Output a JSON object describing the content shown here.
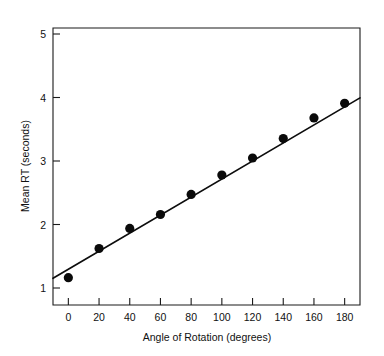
{
  "chart_data": {
    "type": "scatter",
    "title": "",
    "xlabel": "Angle of Rotation (degrees)",
    "ylabel": "Mean RT (seconds)",
    "xlim": [
      -10,
      190
    ],
    "ylim": [
      0.72,
      5.28
    ],
    "grid": false,
    "legend": null,
    "xticks": [
      0,
      20,
      40,
      60,
      80,
      100,
      120,
      140,
      160,
      180
    ],
    "xticklabels": [
      "0",
      "20",
      "40",
      "60",
      "80",
      "100",
      "120",
      "140",
      "160",
      "180"
    ],
    "yticks": [
      1,
      2,
      3,
      4,
      5
    ],
    "yticklabels": [
      "1",
      "2",
      "3",
      "4",
      "5"
    ],
    "x": [
      0,
      20,
      40,
      60,
      80,
      100,
      120,
      140,
      160,
      180
    ],
    "values": [
      1.17,
      1.65,
      1.98,
      2.21,
      2.54,
      2.86,
      3.14,
      3.46,
      3.8,
      4.04
    ],
    "point_color": "#0a0a0a",
    "point_size": 4.6,
    "fit_line": {
      "x": [
        -10,
        190
      ],
      "y": [
        1.16,
        4.13
      ],
      "color": "#0d0d0d",
      "width": 1.7
    }
  }
}
